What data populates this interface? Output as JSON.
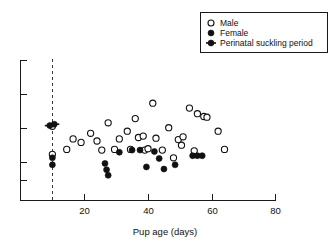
{
  "chart_data": {
    "type": "scatter",
    "title": "",
    "xlabel": "Pup age (days)",
    "ylabel": "",
    "xlim": [
      0,
      80
    ],
    "ylim": [
      0,
      100
    ],
    "xticks": [
      20,
      40,
      60,
      80
    ],
    "xtick_labels": [
      "20",
      "40",
      "60",
      "80"
    ],
    "yticks": [
      20,
      40,
      60,
      80,
      100
    ],
    "ytick_labels": [
      "",
      "",
      "",
      "",
      ""
    ],
    "grid": false,
    "legend_position": "top-right",
    "annotations": [
      {
        "name": "weaning-line",
        "type": "vline",
        "x": 10,
        "style": "dashed"
      }
    ],
    "series": [
      {
        "name": "Male",
        "marker": "open-circle",
        "color": "#ffffff",
        "edge_color": "#111111",
        "points": [
          {
            "x": 10.0,
            "y": 53.0
          },
          {
            "x": 10.0,
            "y": 33.0
          },
          {
            "x": 14.5,
            "y": 36.5
          },
          {
            "x": 16.5,
            "y": 44.0
          },
          {
            "x": 19.0,
            "y": 41.5
          },
          {
            "x": 22.0,
            "y": 48.0
          },
          {
            "x": 24.0,
            "y": 42.5
          },
          {
            "x": 25.5,
            "y": 36.0
          },
          {
            "x": 27.5,
            "y": 55.5
          },
          {
            "x": 29.5,
            "y": 36.5
          },
          {
            "x": 31.0,
            "y": 44.0
          },
          {
            "x": 33.5,
            "y": 49.5
          },
          {
            "x": 34.5,
            "y": 36.5
          },
          {
            "x": 36.0,
            "y": 58.5
          },
          {
            "x": 37.0,
            "y": 45.0
          },
          {
            "x": 38.5,
            "y": 46.0
          },
          {
            "x": 39.0,
            "y": 36.0
          },
          {
            "x": 40.0,
            "y": 37.0
          },
          {
            "x": 41.5,
            "y": 69.5
          },
          {
            "x": 42.5,
            "y": 44.5
          },
          {
            "x": 44.5,
            "y": 36.0
          },
          {
            "x": 46.5,
            "y": 52.0
          },
          {
            "x": 48.0,
            "y": 30.5
          },
          {
            "x": 49.5,
            "y": 43.5
          },
          {
            "x": 50.5,
            "y": 39.5
          },
          {
            "x": 51.0,
            "y": 45.5
          },
          {
            "x": 53.0,
            "y": 66.0
          },
          {
            "x": 54.5,
            "y": 35.5
          },
          {
            "x": 55.5,
            "y": 62.0
          },
          {
            "x": 57.5,
            "y": 60.0
          },
          {
            "x": 58.5,
            "y": 59.5
          },
          {
            "x": 62.0,
            "y": 49.5
          },
          {
            "x": 64.0,
            "y": 36.5
          }
        ]
      },
      {
        "name": "Female",
        "marker": "filled-circle",
        "color": "#111111",
        "edge_color": "#111111",
        "points": [
          {
            "x": 10.0,
            "y": 30.5
          },
          {
            "x": 10.0,
            "y": 25.5
          },
          {
            "x": 26.5,
            "y": 26.5
          },
          {
            "x": 27.0,
            "y": 22.0
          },
          {
            "x": 27.5,
            "y": 18.0
          },
          {
            "x": 31.0,
            "y": 34.5
          },
          {
            "x": 35.0,
            "y": 36.0
          },
          {
            "x": 37.5,
            "y": 36.0
          },
          {
            "x": 39.5,
            "y": 24.0
          },
          {
            "x": 42.0,
            "y": 35.0
          },
          {
            "x": 43.5,
            "y": 30.0
          },
          {
            "x": 45.0,
            "y": 22.5
          },
          {
            "x": 48.5,
            "y": 25.5
          },
          {
            "x": 54.0,
            "y": 32.0
          },
          {
            "x": 55.5,
            "y": 32.0
          },
          {
            "x": 57.0,
            "y": 32.0
          }
        ]
      },
      {
        "name": "Perinatal suckling period",
        "marker": "filled-circle-with-bars",
        "color": "#111111",
        "edge_color": "#111111",
        "points": [
          {
            "x": 9.2,
            "y": 53.5
          },
          {
            "x": 10.6,
            "y": 54.5
          }
        ]
      }
    ]
  },
  "legend": {
    "items": [
      {
        "label": "Male",
        "marker": "open-circle"
      },
      {
        "label": "Female",
        "marker": "filled-circle"
      },
      {
        "label": "Perinatal suckling period",
        "marker": "filled-circle-with-bars"
      }
    ]
  },
  "axes": {
    "x_title": "Pup age (days)",
    "x_tick_labels": [
      "20",
      "40",
      "60",
      "80"
    ]
  }
}
